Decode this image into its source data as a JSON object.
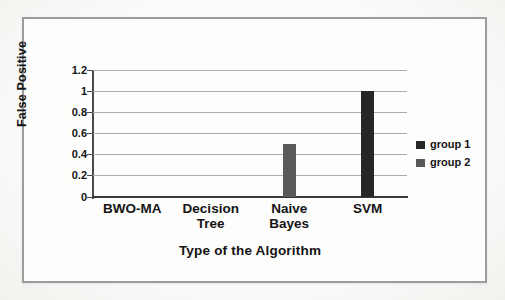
{
  "chart_data": {
    "type": "bar",
    "title": "",
    "xlabel": "Type of the Algorithm",
    "ylabel": "False Positive",
    "categories": [
      "BWO-MA",
      "Decision Tree",
      "Naive Bayes",
      "SVM"
    ],
    "series": [
      {
        "name": "group 1",
        "color": "#262626",
        "values": [
          0,
          0,
          0,
          1
        ]
      },
      {
        "name": "group 2",
        "color": "#595959",
        "values": [
          0,
          0,
          0.5,
          0
        ]
      }
    ],
    "ylim": [
      0,
      1.2
    ],
    "yticks": [
      0,
      0.2,
      0.4,
      0.6,
      0.8,
      1,
      1.2
    ],
    "ytick_labels": [
      "0",
      "0.2",
      "0.4",
      "0.6",
      "0.8",
      "1",
      "1.2"
    ],
    "grid": true,
    "legend_position": "right",
    "bar_width_px": 13
  }
}
